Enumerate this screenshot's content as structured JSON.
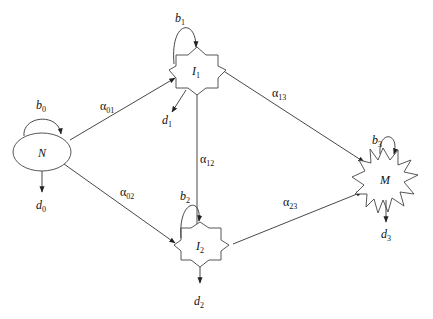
{
  "diagram": {
    "type": "compartment-flow",
    "colors": {
      "stroke": "#333333",
      "background": "#ffffff"
    },
    "nodes": [
      {
        "id": "N",
        "label": "N",
        "sub": "",
        "shape": "ellipse",
        "loop": {
          "label": "b",
          "sub": "0"
        },
        "out": {
          "label": "d",
          "sub": "0"
        }
      },
      {
        "id": "I1",
        "label": "I",
        "sub": "1",
        "shape": "star-8",
        "loop": {
          "label": "b",
          "sub": "1"
        },
        "out": {
          "label": "d",
          "sub": "1"
        }
      },
      {
        "id": "I2",
        "label": "I",
        "sub": "2",
        "shape": "star-8",
        "loop": {
          "label": "b",
          "sub": "2"
        },
        "out": {
          "label": "d",
          "sub": "2"
        }
      },
      {
        "id": "M",
        "label": "M",
        "sub": "",
        "shape": "burst",
        "loop": {
          "label": "b",
          "sub": "3"
        },
        "out": {
          "label": "d",
          "sub": "3"
        }
      }
    ],
    "edges": [
      {
        "from": "N",
        "to": "I1",
        "label": "α",
        "sub": "01"
      },
      {
        "from": "N",
        "to": "I2",
        "label": "α",
        "sub": "02"
      },
      {
        "from": "I1",
        "to": "I2",
        "label": "α",
        "sub": "12"
      },
      {
        "from": "I1",
        "to": "M",
        "label": "α",
        "sub": "13"
      },
      {
        "from": "I2",
        "to": "M",
        "label": "α",
        "sub": "23"
      }
    ]
  }
}
